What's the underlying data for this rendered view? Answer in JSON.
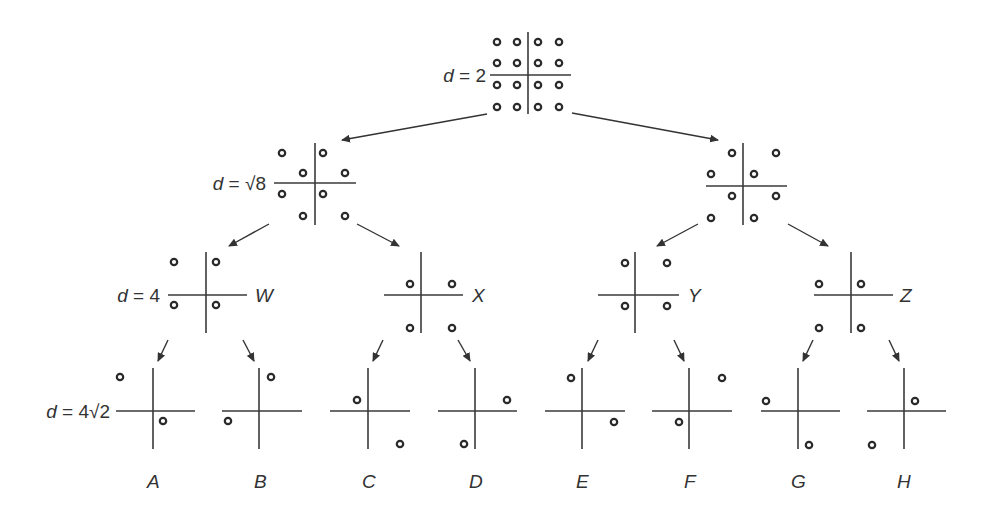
{
  "diagram": {
    "colors": {
      "line": "#3a3a3a",
      "dot_stroke": "#2a2a2a",
      "text": "#333333",
      "background": "#ffffff"
    },
    "levels": [
      {
        "label_prefix": "d = ",
        "label_value": "2",
        "label_x": 486,
        "label_y": 82
      },
      {
        "label_prefix": "d = ",
        "label_value": "√8",
        "label_x": 266,
        "label_y": 190
      },
      {
        "label_prefix": "d = ",
        "label_value": "4",
        "label_x": 160,
        "label_y": 302
      },
      {
        "label_prefix": "d = ",
        "label_value": "4√2",
        "label_x": 110,
        "label_y": 418
      }
    ],
    "nodes": [
      {
        "id": "root",
        "cx": 528,
        "cy": 75,
        "hx1": 490,
        "hx2": 571,
        "vy1": 32,
        "vy2": 114,
        "name": "",
        "points": [
          [
            497,
            42
          ],
          [
            517,
            42
          ],
          [
            538,
            42
          ],
          [
            559,
            42
          ],
          [
            497,
            63
          ],
          [
            517,
            63
          ],
          [
            538,
            63
          ],
          [
            559,
            63
          ],
          [
            497,
            85
          ],
          [
            517,
            85
          ],
          [
            538,
            85
          ],
          [
            559,
            85
          ],
          [
            497,
            107
          ],
          [
            517,
            107
          ],
          [
            538,
            107
          ],
          [
            559,
            107
          ]
        ]
      },
      {
        "id": "L1-left",
        "cx": 315,
        "cy": 183,
        "hx1": 274,
        "hx2": 356,
        "vy1": 143,
        "vy2": 225,
        "name": "",
        "points": [
          [
            282,
            153
          ],
          [
            323,
            153
          ],
          [
            303,
            173
          ],
          [
            345,
            173
          ],
          [
            282,
            194
          ],
          [
            323,
            194
          ],
          [
            303,
            216
          ],
          [
            345,
            216
          ]
        ]
      },
      {
        "id": "L1-right",
        "cx": 743,
        "cy": 186,
        "hx1": 706,
        "hx2": 787,
        "vy1": 143,
        "vy2": 225,
        "name": "",
        "points": [
          [
            732,
            153
          ],
          [
            776,
            153
          ],
          [
            711,
            174
          ],
          [
            754,
            174
          ],
          [
            732,
            196
          ],
          [
            776,
            196
          ],
          [
            711,
            218
          ],
          [
            754,
            218
          ]
        ]
      },
      {
        "id": "W",
        "cx": 206,
        "cy": 295,
        "hx1": 168,
        "hx2": 247,
        "vy1": 252,
        "vy2": 333,
        "name": "W",
        "name_x": 255,
        "name_y": 302,
        "points": [
          [
            174,
            262
          ],
          [
            216,
            262
          ],
          [
            174,
            305
          ],
          [
            216,
            305
          ]
        ]
      },
      {
        "id": "X",
        "cx": 421,
        "cy": 295,
        "hx1": 384,
        "hx2": 463,
        "vy1": 252,
        "vy2": 333,
        "name": "X",
        "name_x": 472,
        "name_y": 302,
        "points": [
          [
            410,
            284
          ],
          [
            452,
            284
          ],
          [
            410,
            328
          ],
          [
            452,
            328
          ]
        ]
      },
      {
        "id": "Y",
        "cx": 635,
        "cy": 295,
        "hx1": 598,
        "hx2": 679,
        "vy1": 252,
        "vy2": 333,
        "name": "Y",
        "name_x": 688,
        "name_y": 302,
        "points": [
          [
            625,
            263
          ],
          [
            667,
            263
          ],
          [
            625,
            306
          ],
          [
            667,
            306
          ]
        ]
      },
      {
        "id": "Z",
        "cx": 851,
        "cy": 295,
        "hx1": 814,
        "hx2": 893,
        "vy1": 252,
        "vy2": 333,
        "name": "Z",
        "name_x": 900,
        "name_y": 302,
        "points": [
          [
            819,
            284
          ],
          [
            861,
            284
          ],
          [
            819,
            328
          ],
          [
            861,
            328
          ]
        ]
      },
      {
        "id": "A",
        "cx": 153,
        "cy": 411,
        "hx1": 116,
        "hx2": 195,
        "vy1": 368,
        "vy2": 449,
        "name": "A",
        "name_x": 147,
        "name_y": 488,
        "points": [
          [
            120,
            377
          ],
          [
            163,
            421
          ]
        ]
      },
      {
        "id": "B",
        "cx": 259,
        "cy": 411,
        "hx1": 222,
        "hx2": 302,
        "vy1": 368,
        "vy2": 449,
        "name": "B",
        "name_x": 254,
        "name_y": 488,
        "points": [
          [
            271,
            377
          ],
          [
            228,
            421
          ]
        ]
      },
      {
        "id": "C",
        "cx": 368,
        "cy": 411,
        "hx1": 330,
        "hx2": 410,
        "vy1": 368,
        "vy2": 449,
        "name": "C",
        "name_x": 362,
        "name_y": 488,
        "points": [
          [
            357,
            400
          ],
          [
            400,
            444
          ]
        ]
      },
      {
        "id": "D",
        "cx": 475,
        "cy": 411,
        "hx1": 438,
        "hx2": 517,
        "vy1": 368,
        "vy2": 449,
        "name": "D",
        "name_x": 469,
        "name_y": 488,
        "points": [
          [
            507,
            400
          ],
          [
            464,
            444
          ]
        ]
      },
      {
        "id": "E",
        "cx": 582,
        "cy": 411,
        "hx1": 545,
        "hx2": 625,
        "vy1": 368,
        "vy2": 449,
        "name": "E",
        "name_x": 576,
        "name_y": 488,
        "points": [
          [
            571,
            378
          ],
          [
            614,
            422
          ]
        ]
      },
      {
        "id": "F",
        "cx": 689,
        "cy": 411,
        "hx1": 652,
        "hx2": 732,
        "vy1": 368,
        "vy2": 449,
        "name": "F",
        "name_x": 684,
        "name_y": 488,
        "points": [
          [
            722,
            378
          ],
          [
            679,
            422
          ]
        ]
      },
      {
        "id": "G",
        "cx": 798,
        "cy": 411,
        "hx1": 761,
        "hx2": 840,
        "vy1": 368,
        "vy2": 449,
        "name": "G",
        "name_x": 791,
        "name_y": 488,
        "points": [
          [
            766,
            401
          ],
          [
            809,
            445
          ]
        ]
      },
      {
        "id": "H",
        "cx": 904,
        "cy": 411,
        "hx1": 867,
        "hx2": 946,
        "vy1": 368,
        "vy2": 449,
        "name": "H",
        "name_x": 897,
        "name_y": 488,
        "points": [
          [
            915,
            401
          ],
          [
            872,
            445
          ]
        ]
      }
    ],
    "edges": [
      {
        "from": "root",
        "to": "L1-left",
        "x1": 487,
        "y1": 114,
        "x2": 342,
        "y2": 140
      },
      {
        "from": "root",
        "to": "L1-right",
        "x1": 572,
        "y1": 113,
        "x2": 718,
        "y2": 140
      },
      {
        "from": "L1-left",
        "to": "W",
        "x1": 269,
        "y1": 224,
        "x2": 229,
        "y2": 246
      },
      {
        "from": "L1-left",
        "to": "X",
        "x1": 357,
        "y1": 224,
        "x2": 399,
        "y2": 246
      },
      {
        "from": "L1-right",
        "to": "Y",
        "x1": 698,
        "y1": 224,
        "x2": 657,
        "y2": 246
      },
      {
        "from": "L1-right",
        "to": "Z",
        "x1": 788,
        "y1": 224,
        "x2": 828,
        "y2": 246
      },
      {
        "from": "W",
        "to": "A",
        "x1": 168,
        "y1": 340,
        "x2": 158,
        "y2": 361
      },
      {
        "from": "W",
        "to": "B",
        "x1": 243,
        "y1": 340,
        "x2": 254,
        "y2": 361
      },
      {
        "from": "X",
        "to": "C",
        "x1": 383,
        "y1": 340,
        "x2": 373,
        "y2": 361
      },
      {
        "from": "X",
        "to": "D",
        "x1": 458,
        "y1": 340,
        "x2": 470,
        "y2": 361
      },
      {
        "from": "Y",
        "to": "E",
        "x1": 598,
        "y1": 340,
        "x2": 588,
        "y2": 361
      },
      {
        "from": "Y",
        "to": "F",
        "x1": 674,
        "y1": 340,
        "x2": 684,
        "y2": 361
      },
      {
        "from": "Z",
        "to": "G",
        "x1": 813,
        "y1": 340,
        "x2": 803,
        "y2": 361
      },
      {
        "from": "Z",
        "to": "H",
        "x1": 889,
        "y1": 340,
        "x2": 899,
        "y2": 361
      }
    ]
  }
}
